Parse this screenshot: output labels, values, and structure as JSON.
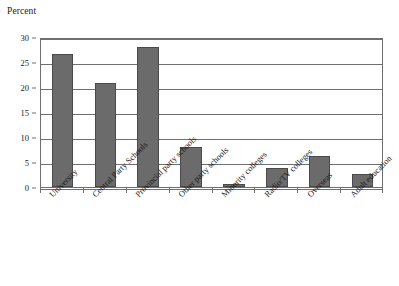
{
  "chart_data": {
    "type": "bar",
    "title": "Percent",
    "xlabel": "",
    "ylabel": "Percent",
    "ylim": [
      0,
      30
    ],
    "yticks": [
      0,
      5,
      10,
      15,
      20,
      25,
      30
    ],
    "grid": true,
    "legend": false,
    "orientation": "vertical",
    "bar_color": "#6b6b6b",
    "bar_edge_color": "#4a4a4a",
    "axis_color": "#6f6f6f",
    "label_rotation": -45,
    "categories": [
      "University",
      "Central Party Schools",
      "Provincial party schools",
      "Other party schools",
      "Minority colleges",
      "Radio/TV colleges",
      "Overseas",
      "Adult education"
    ],
    "values": [
      26.6,
      20.8,
      28.0,
      8.0,
      0.7,
      3.8,
      6.2,
      2.6
    ]
  },
  "ytick_labels": [
    "0",
    "5",
    "10",
    "15",
    "20",
    "25",
    "30"
  ]
}
